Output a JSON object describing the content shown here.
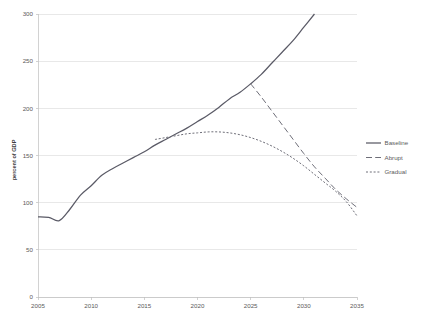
{
  "chart_data": {
    "type": "line",
    "title": "",
    "subtitle": "",
    "xlabel": "",
    "ylabel": "percent of GDP",
    "xlim": [
      2005,
      2035
    ],
    "ylim": [
      0,
      300
    ],
    "grid": true,
    "legend_position": "right",
    "x_ticks": [
      "2005",
      "2010",
      "2015",
      "2020",
      "2025",
      "2030",
      "2035"
    ],
    "x_tick_values": [
      2005,
      2010,
      2015,
      2020,
      2025,
      2030,
      2035
    ],
    "y_ticks": [
      "0",
      "50",
      "100",
      "150",
      "200",
      "250",
      "300"
    ],
    "y_tick_values": [
      0,
      50,
      100,
      150,
      200,
      250,
      300
    ],
    "colors": {
      "baseline": "#5a5a66",
      "abrupt": "#6e6e78",
      "gradual": "#6e6e78",
      "gridline": "#d9d9d9",
      "axis": "#bfbfbf",
      "text": "#5b5b5b",
      "background": "#ffffff"
    },
    "series": [
      {
        "name": "Baseline",
        "style": "solid",
        "x": [
          2005,
          2006,
          2007,
          2008,
          2009,
          2010,
          2011,
          2012,
          2013,
          2014,
          2015,
          2016,
          2017,
          2018,
          2019,
          2020,
          2021,
          2022,
          2023,
          2024,
          2025,
          2026,
          2027,
          2028,
          2029,
          2030,
          2031
        ],
        "values": [
          85,
          84.5,
          81,
          93,
          108,
          118,
          129,
          136,
          142,
          148,
          154,
          161,
          167,
          173,
          179,
          186,
          193,
          201,
          210,
          217,
          226,
          236,
          248,
          260,
          272,
          286,
          300
        ]
      },
      {
        "name": "Abrupt",
        "style": "dashed",
        "x": [
          2025,
          2026,
          2027,
          2028,
          2029,
          2030,
          2031,
          2032,
          2033,
          2034,
          2035
        ],
        "values": [
          226,
          212,
          197,
          182,
          167,
          152,
          138,
          126,
          114,
          104,
          95
        ]
      },
      {
        "name": "Gradual",
        "style": "dotted",
        "x": [
          2016,
          2017,
          2018,
          2019,
          2020,
          2021,
          2022,
          2023,
          2024,
          2025,
          2026,
          2027,
          2028,
          2029,
          2030,
          2031,
          2032,
          2033,
          2034,
          2035
        ],
        "values": [
          167,
          169,
          171,
          173,
          174,
          175,
          175,
          174,
          172,
          169,
          165,
          160,
          154,
          147,
          139,
          130,
          121,
          112,
          101,
          86
        ]
      }
    ],
    "legend_items": [
      {
        "label": "Baseline",
        "style": "solid"
      },
      {
        "label": "Abrupt",
        "style": "dashed"
      },
      {
        "label": "Gradual",
        "style": "dotted"
      }
    ]
  }
}
